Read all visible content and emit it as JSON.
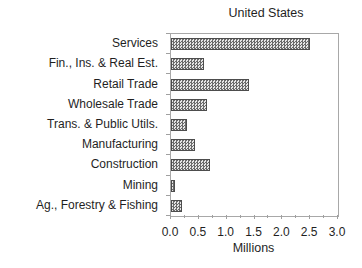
{
  "chart_data": {
    "type": "bar",
    "orientation": "horizontal",
    "title": "United States",
    "xlabel": "Millions",
    "categories": [
      "Services",
      "Fin., Ins. & Real Est.",
      "Retail Trade",
      "Wholesale Trade",
      "Trans. & Public Utils.",
      "Manufacturing",
      "Construction",
      "Mining",
      "Ag., Forestry & Fishing"
    ],
    "values": [
      2.5,
      0.6,
      1.4,
      0.65,
      0.28,
      0.43,
      0.7,
      0.07,
      0.2
    ],
    "xlim": [
      0,
      3
    ],
    "xtick_labels": [
      "0.0",
      "0.5",
      "1.0",
      "1.5",
      "2.0",
      "2.5",
      "3.0"
    ],
    "minor_tick_step": 0.25,
    "grid": false,
    "legend": "none",
    "bar_pattern": "gray-stipple",
    "colors": {
      "bar_dot": "#6a6a6a",
      "bar_background": "#e6e6e6",
      "bar_border": "#4d4d4d",
      "axis": "#a0a0a0",
      "text": "#1f1f1f",
      "background": "#ffffff"
    }
  }
}
